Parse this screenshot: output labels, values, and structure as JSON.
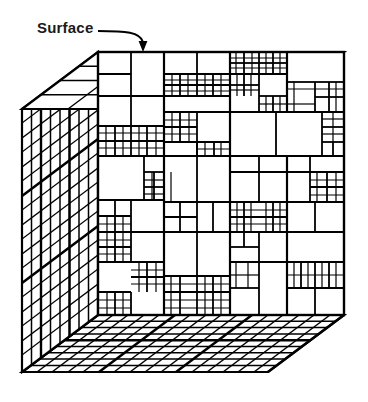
{
  "figure": {
    "type": "diagram",
    "background_color": "#ffffff",
    "line_color": "#000000",
    "text_color": "#1a1a1a"
  },
  "annotations": {
    "surface": {
      "label": "Surface",
      "leader": "curved-arrow",
      "points_to": "top-face-of-cube",
      "arrow_tip": {
        "x": 143,
        "y": 52
      }
    }
  },
  "geometry": {
    "front_face": {
      "name": "front-face",
      "x": 98,
      "y": 52,
      "width": 246,
      "height": 263
    },
    "depth_vector": {
      "dx": -76,
      "dy": 57
    },
    "top_face": {
      "name": "top-face"
    },
    "left_face": {
      "name": "left-face"
    },
    "bottom_face": {
      "name": "bottom-face"
    },
    "corners": {
      "front_top_left": {
        "x": 98,
        "y": 52
      },
      "front_top_right": {
        "x": 344,
        "y": 52
      },
      "front_bottom_left": {
        "x": 98,
        "y": 315
      },
      "front_bottom_right": {
        "x": 344,
        "y": 315
      },
      "back_top_left": {
        "x": 22,
        "y": 109
      },
      "back_bottom_left": {
        "x": 22,
        "y": 372
      },
      "back_bottom_right": {
        "x": 268,
        "y": 372
      }
    }
  },
  "subdivision": {
    "description": "Quadtree cell boundaries drawn on each visible face",
    "front_face_cells": [
      [
        98,
        52,
        46,
        44
      ],
      [
        144,
        52,
        33,
        30
      ],
      [
        177,
        52,
        33,
        30
      ],
      [
        144,
        82,
        16,
        15
      ],
      [
        160,
        82,
        17,
        15
      ],
      [
        144,
        97,
        16,
        15
      ],
      [
        160,
        97,
        17,
        15
      ],
      [
        177,
        82,
        33,
        30
      ],
      [
        210,
        52,
        17,
        15
      ],
      [
        227,
        52,
        16,
        15
      ],
      [
        210,
        67,
        17,
        15
      ],
      [
        227,
        67,
        16,
        15
      ],
      [
        243,
        52,
        33,
        30
      ],
      [
        210,
        82,
        33,
        30
      ],
      [
        276,
        52,
        17,
        15
      ],
      [
        293,
        52,
        17,
        15
      ],
      [
        276,
        67,
        17,
        15
      ],
      [
        293,
        67,
        17,
        15
      ],
      [
        310,
        52,
        34,
        30
      ],
      [
        276,
        82,
        34,
        30
      ],
      [
        310,
        82,
        17,
        15
      ],
      [
        327,
        82,
        17,
        15
      ],
      [
        310,
        97,
        17,
        15
      ],
      [
        327,
        97,
        17,
        15
      ],
      [
        98,
        96,
        33,
        30
      ],
      [
        131,
        96,
        33,
        30
      ],
      [
        98,
        126,
        17,
        15
      ],
      [
        115,
        126,
        16,
        15
      ],
      [
        98,
        141,
        17,
        15
      ],
      [
        115,
        141,
        16,
        15
      ],
      [
        131,
        126,
        16,
        15
      ],
      [
        147,
        126,
        17,
        15
      ],
      [
        131,
        141,
        16,
        15
      ],
      [
        147,
        141,
        17,
        15
      ],
      [
        164,
        112,
        16,
        15
      ],
      [
        180,
        112,
        17,
        15
      ],
      [
        164,
        127,
        16,
        15
      ],
      [
        180,
        127,
        17,
        15
      ],
      [
        164,
        142,
        33,
        30
      ],
      [
        197,
        112,
        33,
        30
      ],
      [
        197,
        142,
        17,
        15
      ],
      [
        214,
        142,
        16,
        15
      ],
      [
        230,
        112,
        46,
        60
      ],
      [
        276,
        112,
        46,
        60
      ],
      [
        322,
        112,
        22,
        30
      ],
      [
        322,
        142,
        11,
        15
      ],
      [
        333,
        142,
        11,
        15
      ],
      [
        98,
        156,
        46,
        44
      ],
      [
        144,
        172,
        16,
        15
      ],
      [
        160,
        172,
        17,
        15
      ],
      [
        144,
        187,
        16,
        15
      ],
      [
        160,
        187,
        17,
        15
      ],
      [
        177,
        172,
        33,
        30
      ],
      [
        177,
        202,
        16,
        15
      ],
      [
        193,
        202,
        17,
        15
      ],
      [
        210,
        172,
        33,
        30
      ],
      [
        210,
        202,
        33,
        30
      ],
      [
        243,
        172,
        33,
        30
      ],
      [
        243,
        202,
        17,
        15
      ],
      [
        260,
        202,
        16,
        15
      ],
      [
        276,
        172,
        34,
        30
      ],
      [
        310,
        172,
        17,
        15
      ],
      [
        327,
        172,
        17,
        15
      ],
      [
        310,
        187,
        17,
        15
      ],
      [
        327,
        187,
        17,
        15
      ],
      [
        276,
        202,
        34,
        30
      ],
      [
        310,
        202,
        34,
        30
      ],
      [
        98,
        216,
        17,
        15
      ],
      [
        115,
        216,
        16,
        15
      ],
      [
        98,
        231,
        17,
        15
      ],
      [
        115,
        231,
        16,
        15
      ],
      [
        131,
        216,
        46,
        44
      ],
      [
        177,
        232,
        46,
        44
      ],
      [
        223,
        232,
        17,
        15
      ],
      [
        240,
        232,
        16,
        15
      ],
      [
        256,
        232,
        20,
        22
      ],
      [
        276,
        232,
        34,
        30
      ],
      [
        310,
        232,
        17,
        15
      ],
      [
        327,
        232,
        17,
        15
      ],
      [
        310,
        247,
        17,
        15
      ],
      [
        327,
        247,
        17,
        15
      ],
      [
        98,
        262,
        33,
        30
      ],
      [
        131,
        262,
        16,
        15
      ],
      [
        147,
        262,
        17,
        15
      ],
      [
        131,
        277,
        16,
        15
      ],
      [
        147,
        277,
        17,
        15
      ],
      [
        164,
        262,
        33,
        30
      ],
      [
        197,
        262,
        17,
        15
      ],
      [
        214,
        262,
        16,
        15
      ],
      [
        230,
        262,
        46,
        53
      ],
      [
        276,
        278,
        17,
        15
      ],
      [
        293,
        278,
        17,
        15
      ],
      [
        276,
        293,
        17,
        15
      ],
      [
        293,
        293,
        17,
        15
      ],
      [
        310,
        278,
        34,
        37
      ]
    ],
    "left_face_strips": 9,
    "bottom_face_strips": 8,
    "top_face_strips": 4
  }
}
